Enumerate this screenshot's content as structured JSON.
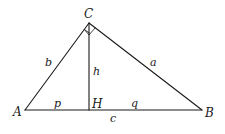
{
  "diagram": {
    "vertices": {
      "A": "A",
      "B": "B",
      "C": "C",
      "H": "H"
    },
    "sides": {
      "a": "a",
      "b": "b",
      "c": "c",
      "h": "h",
      "p": "p",
      "q": "q"
    },
    "right_angle_at": "C",
    "colors": {
      "stroke": "#1a1a1a",
      "background": "#ffffff"
    }
  }
}
